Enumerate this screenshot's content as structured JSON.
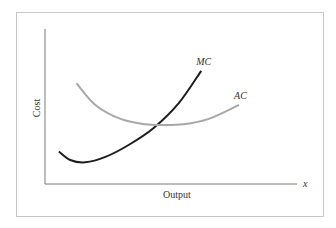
{
  "chart_data": {
    "type": "line",
    "title": "",
    "xlabel": "Output",
    "ylabel": "Cost",
    "x_axis_symbol": "x",
    "grid": false,
    "legend": "none",
    "xlim": [
      0,
      10
    ],
    "ylim": [
      0,
      10
    ],
    "series": [
      {
        "name": "MC",
        "label": "MC",
        "color": "#1e1e1e",
        "x": [
          0.55,
          1.0,
          1.6,
          2.4,
          3.3,
          4.3,
          5.3,
          6.2
        ],
        "y": [
          2.1,
          1.55,
          1.4,
          1.75,
          2.5,
          3.6,
          5.2,
          7.3
        ]
      },
      {
        "name": "AC",
        "label": "AC",
        "color": "#a8a8a8",
        "x": [
          1.25,
          2.0,
          3.0,
          4.0,
          4.6,
          5.5,
          6.5,
          7.7
        ],
        "y": [
          6.5,
          5.1,
          4.2,
          3.85,
          3.8,
          3.85,
          4.2,
          5.1
        ]
      }
    ]
  }
}
